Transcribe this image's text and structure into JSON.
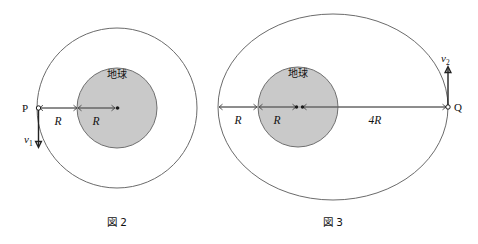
{
  "page": {
    "background_color": "#ffffff",
    "width": 478,
    "height": 244
  },
  "colors": {
    "earth_fill": "#c9c9c9",
    "earth_stroke": "#6f6f6f",
    "orbit_stroke": "#6b6b6b",
    "axis_stroke": "#8a8a8a",
    "text": "#111111"
  },
  "figures": [
    {
      "id": "figure-2",
      "caption": "図 2",
      "orbit_type": "circular",
      "earth_label": "地球",
      "point_label": "P",
      "velocity_label": "v",
      "velocity_subscript": "1",
      "velocity_direction": "down",
      "dimensions": [
        {
          "label": "R",
          "span": "P to Earth surface"
        },
        {
          "label": "R",
          "span": "Earth surface to center"
        }
      ],
      "geometry": {
        "center_x": 117,
        "center_y": 108,
        "orbit_radius": 80,
        "earth_radius": 40
      }
    },
    {
      "id": "figure-3",
      "caption": "図 3",
      "orbit_type": "elliptical",
      "earth_label": "地球",
      "point_label": "Q",
      "velocity_label": "v",
      "velocity_subscript": "2",
      "velocity_direction": "up",
      "dimensions": [
        {
          "label": "R",
          "span": "Ellipse near vertex to Earth surface"
        },
        {
          "label": "R",
          "span": "Earth surface to center"
        },
        {
          "label": "4R",
          "span": "Earth center to Q"
        }
      ],
      "geometry": {
        "center_x": 333,
        "center_y": 107,
        "semi_major": 115,
        "semi_minor": 93,
        "earth_center_x": 298,
        "earth_radius": 40,
        "apogee_x": 448
      }
    }
  ]
}
